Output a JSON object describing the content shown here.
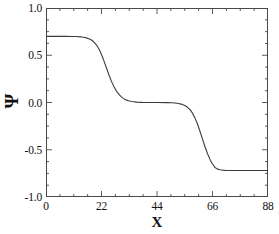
{
  "chart_data": {
    "type": "line",
    "title": "",
    "xlabel": "X",
    "ylabel": "Ψ",
    "xlim": [
      0,
      88
    ],
    "ylim": [
      -1.0,
      1.0
    ],
    "xticks": [
      0,
      22,
      44,
      66,
      88
    ],
    "xtick_labels": [
      "0",
      "22",
      "44",
      "66",
      "88"
    ],
    "yticks": [
      -1.0,
      -0.5,
      0.0,
      0.5,
      1.0
    ],
    "ytick_labels": [
      "-1.0",
      "-0.5",
      "0.0",
      "0.5",
      "1.0"
    ],
    "xminor_interval": 5.5,
    "yminor_interval": 0.125,
    "grid": false,
    "legend": null,
    "line_color": "#3c3c3c",
    "frame_color": "#4a4a4a",
    "series": [
      {
        "name": "psi",
        "description": "double-kink staircase profile: plateau at 0.70, step down to 0.00, step down to -0.72",
        "plateau_values": [
          0.7,
          0.0,
          -0.72
        ],
        "kink_centers": [
          22.5,
          64.0
        ],
        "kink_widths": [
          3.6,
          4.2
        ],
        "x": [
          0,
          2,
          4,
          6,
          8,
          10,
          12,
          14,
          15,
          16,
          17,
          18,
          19,
          20,
          21,
          22,
          22.5,
          23,
          24,
          25,
          26,
          27,
          28,
          29,
          30,
          31,
          32,
          33,
          34,
          36,
          38,
          40,
          44,
          48,
          50,
          52,
          54,
          55,
          56,
          57,
          58,
          59,
          60,
          61,
          62,
          63,
          64,
          65,
          66,
          67,
          68,
          69,
          70,
          71,
          72,
          73,
          74,
          76,
          78,
          80,
          82,
          84,
          86,
          88
        ],
        "y": [
          0.7,
          0.7,
          0.7,
          0.7,
          0.7,
          0.699,
          0.698,
          0.694,
          0.69,
          0.684,
          0.675,
          0.661,
          0.64,
          0.609,
          0.566,
          0.508,
          0.474,
          0.438,
          0.362,
          0.288,
          0.221,
          0.164,
          0.118,
          0.083,
          0.057,
          0.038,
          0.025,
          0.016,
          0.01,
          0.004,
          0.001,
          0.0,
          0.0,
          -0.001,
          -0.003,
          -0.008,
          -0.02,
          -0.031,
          -0.048,
          -0.073,
          -0.11,
          -0.16,
          -0.225,
          -0.302,
          -0.385,
          -0.466,
          -0.54,
          -0.602,
          -0.651,
          -0.687,
          -0.705,
          -0.712,
          -0.716,
          -0.718,
          -0.719,
          -0.72,
          -0.72,
          -0.72,
          -0.72,
          -0.72,
          -0.72,
          -0.72,
          -0.72,
          -0.72
        ]
      }
    ]
  }
}
